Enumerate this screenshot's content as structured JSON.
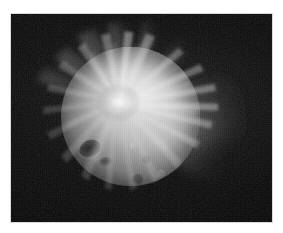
{
  "figure": {
    "kind": "grayscale-planetary-image",
    "alt_text": "Grayscale telescopic image of a spherical planetary body with a bright radial impact ray system and ejecta plumes extending beyond the limb",
    "canvas_width_px": 283,
    "canvas_height_px": 233,
    "background_color": "#ffffff"
  },
  "plate": {
    "name": "image-plate",
    "left_px": 11,
    "top_px": 14,
    "width_px": 261,
    "height_px": 208,
    "background_color": "#050505",
    "border_color": "#d8d8d8"
  },
  "body": {
    "label": "planetary-disk",
    "center_x_px": 130,
    "center_y_px": 116,
    "diameter_px": 139,
    "highlight_color": "#e9e9e9",
    "midtone_color": "#b2b2b2",
    "terminator_color": "#1a1a1a",
    "illumination": "upper-right",
    "features": [
      {
        "name": "dark-crater-major",
        "x_px": 90,
        "y_px": 148,
        "width_px": 22,
        "height_px": 17,
        "tone": "#141414"
      },
      {
        "name": "dark-crater-minor",
        "x_px": 105,
        "y_px": 161,
        "width_px": 13,
        "height_px": 9,
        "tone": "#2a2a2a"
      },
      {
        "name": "mottled-craterfield",
        "region": "lower-left-quadrant",
        "tone": "#7a7a7a"
      }
    ]
  },
  "ray_system": {
    "label": "impact-ray-burst",
    "origin_x_px": 130,
    "origin_y_px": 97,
    "ray_count": 26,
    "bright_color": "#f2f2f2",
    "span_degrees": 360,
    "max_radius_px": 120
  },
  "plumes": {
    "label": "ejecta-plumes",
    "highlight_color": "#cfcfcf",
    "items": [
      {
        "name": "plume-up-left",
        "angle_deg": -148,
        "length_px": 72,
        "spread_px": 26
      },
      {
        "name": "plume-up-left-mid",
        "angle_deg": -128,
        "length_px": 66,
        "spread_px": 22
      },
      {
        "name": "plume-up",
        "angle_deg": -104,
        "length_px": 74,
        "spread_px": 24
      },
      {
        "name": "plume-up-right",
        "angle_deg": -78,
        "length_px": 70,
        "spread_px": 26
      },
      {
        "name": "plume-right-upper",
        "angle_deg": -34,
        "length_px": 108,
        "spread_px": 46
      },
      {
        "name": "plume-right",
        "angle_deg": -6,
        "length_px": 122,
        "spread_px": 54
      },
      {
        "name": "plume-right-lower",
        "angle_deg": 22,
        "length_px": 96,
        "spread_px": 44
      }
    ]
  },
  "space": {
    "label": "background-sky",
    "color": "#050505",
    "glow_color": "#282828"
  }
}
